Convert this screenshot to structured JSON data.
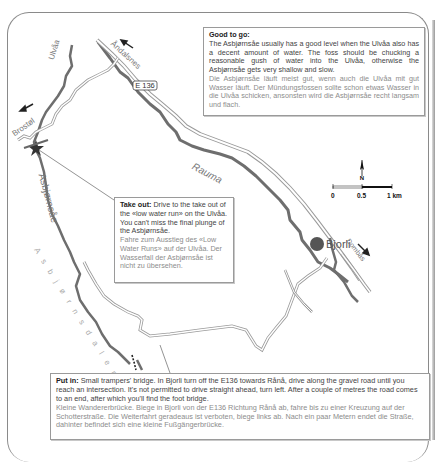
{
  "map": {
    "labels": {
      "ulvaa": "Ulvåa",
      "brostolen": "Brostøl",
      "andalsnes": "Åndalsnes",
      "e136": "E 136",
      "rauma": "Rauma",
      "asbjornsae": "Asbjørnsåe",
      "asbjornsdalen": "A s b j ø r n s d a l e n",
      "bjorli": "Bjorli",
      "dombas": "Dombås",
      "north": "N"
    },
    "scale": {
      "ticks": [
        "0",
        "0.5",
        "1 km"
      ]
    },
    "colors": {
      "river": "#6e6e6e",
      "road": "#9a9a9a",
      "town": "#555555",
      "frame": "#8a8a8a"
    }
  },
  "good_to_go": {
    "heading": "Good to go:",
    "text_en": "The Asbjørnsåe usually has a good level when the Ulvåa also has a decent amount of water. The foss should be chucking a reasonable gush of water into the Ulvåa, otherwise the Asbjørnsåe gets very shallow and slow.",
    "text_de": "Die Asbjørnsåe läuft meist gut, wenn auch die Ulvåa mit gut Wasser läuft. Der Mündungsfossen sollte schon etwas Wasser in die Ulvåa schicken, ansonsten wird die Asbjørnsåe recht langsam und flach."
  },
  "take_out": {
    "heading": "Take out:",
    "text_en": "Drive to the take out of the «low water run» on the Ulvåa. You can't miss the final plunge of the Asbjørnsåe.",
    "text_de": "Fahre zum Ausstieg des «Low Water Runs» auf der Ulvåa. Der Wasserfall der Asbjørnsåe ist nicht zu übersehen."
  },
  "put_in": {
    "heading": "Put in:",
    "text_en": "Small trampers' bridge. In Bjorli turn off the E136 towards Rånå, drive along the gravel road until you reach an intersection. It's not permitted to drive straight ahead, turn left. After a couple of metres the road comes to an end, after which you'll find the foot bridge.",
    "text_de": "Kleine Wandererbrücke. Biege in Bjorli von der E136 Richtung Rånå ab, fahre bis zu einer Kreuzung auf der Schotterstraße. Die Weiterfahrt geradeaus ist verboten, biege links ab. Nach ein paar Metern endet die Straße, dahinter befindet sich eine kleine Fußgängerbrücke."
  }
}
